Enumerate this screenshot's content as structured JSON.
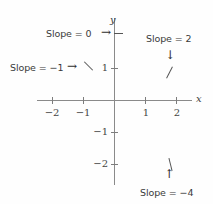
{
  "figure": {
    "type": "coordinate-plane-slope-diagram",
    "background_color": "#fefefe",
    "stroke_color": "#8a8a8a",
    "text_color": "#3a3a3a"
  },
  "axes": {
    "x_label": "x",
    "y_label": "y",
    "x_ticks": [
      {
        "value": "-2",
        "label": "−2"
      },
      {
        "value": "-1",
        "label": "−1"
      },
      {
        "value": "1",
        "label": "1"
      },
      {
        "value": "2",
        "label": "2"
      }
    ],
    "y_ticks": [
      {
        "value": "1",
        "label": "1"
      },
      {
        "value": "-1",
        "label": "−1"
      },
      {
        "value": "-2",
        "label": "−2"
      }
    ],
    "xlim": [
      -2.6,
      2.6
    ],
    "ylim": [
      -2.6,
      2.6
    ]
  },
  "callouts": [
    {
      "id": "slope-zero",
      "text": "Slope = 0",
      "arrow": "→",
      "arrow_direction": "right",
      "slope_value": 0,
      "mark_angle_deg": 0
    },
    {
      "id": "slope-negative-one",
      "text": "Slope = −1",
      "arrow": "→",
      "arrow_direction": "right",
      "slope_value": -1,
      "mark_angle_deg": 45
    },
    {
      "id": "slope-two",
      "text": "Slope = 2",
      "arrow": "↓",
      "arrow_direction": "down",
      "slope_value": 2,
      "mark_angle_deg": -63
    },
    {
      "id": "slope-negative-four",
      "text": "Slope = −4",
      "arrow": "↑",
      "arrow_direction": "up",
      "slope_value": -4,
      "mark_angle_deg": 76
    }
  ]
}
